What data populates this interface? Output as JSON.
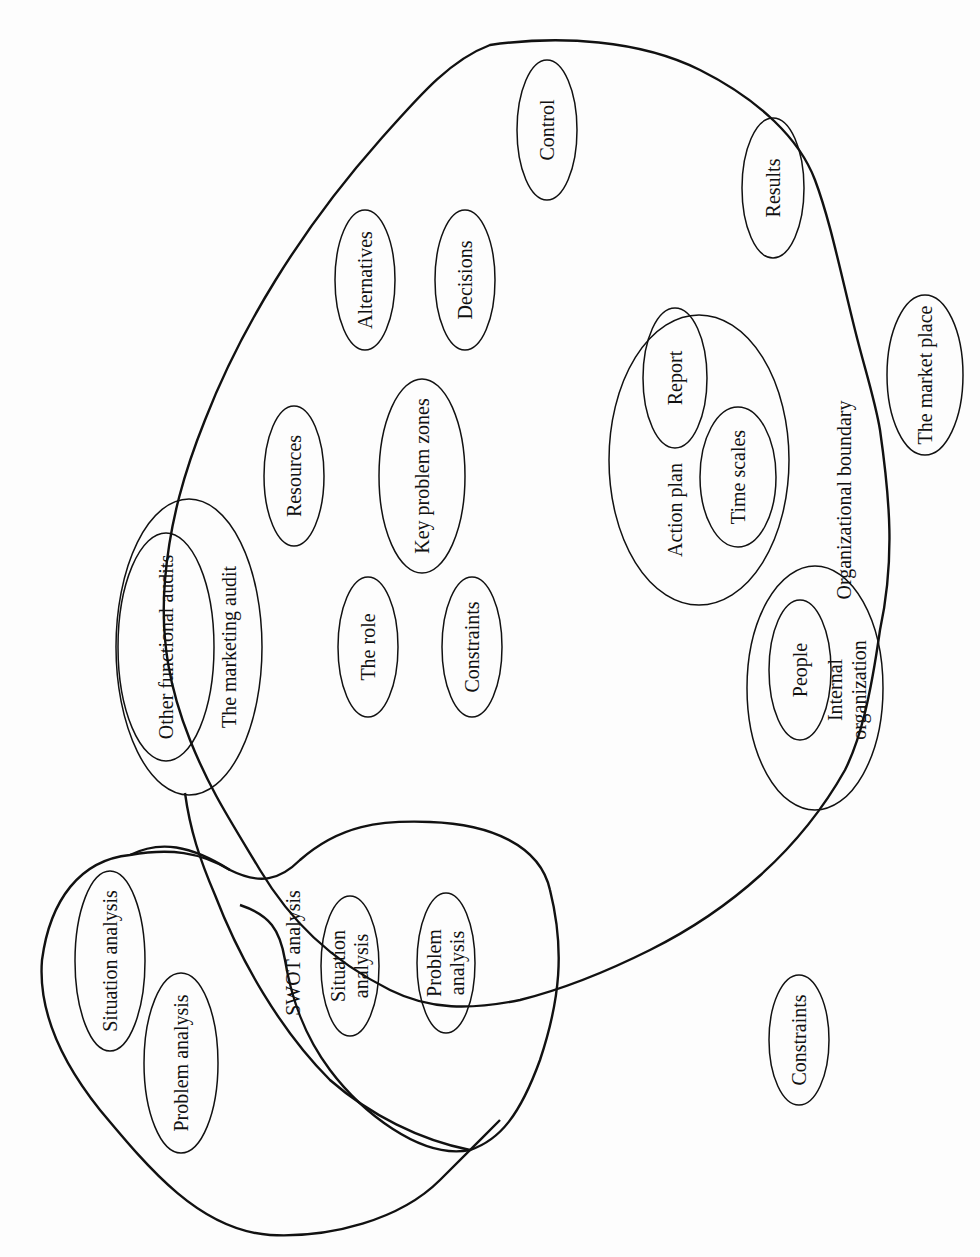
{
  "diagram": {
    "type": "concept-map",
    "orientation": "rotated-90-ccw",
    "stroke_color": "#111111",
    "background_color": "#fdfdfd",
    "regions": {
      "organizational_boundary": "Organizational boundary",
      "swot_analysis": "SWOT analysis"
    },
    "nodes": {
      "control": "Control",
      "results": "Results",
      "alternatives": "Alternatives",
      "decisions": "Decisions",
      "market_place": "The market place",
      "report": "Report",
      "action_plan": "Action plan",
      "time_scales": "Time scales",
      "resources": "Resources",
      "key_problem_zones": "Key problem zones",
      "other_functional_audits": "Other functional audits",
      "marketing_audit": "The marketing audit",
      "the_role": "The role",
      "constraints_inner": "Constraints",
      "people": "People",
      "internal_organization_1": "Internal",
      "internal_organization_2": "organization",
      "situation_analysis_outer": "Situation analysis",
      "problem_analysis_outer": "Problem analysis",
      "situation_analysis_swot_1": "Situation",
      "situation_analysis_swot_2": "analysis",
      "problem_analysis_swot_1": "Problem",
      "problem_analysis_swot_2": "analysis",
      "constraints_outer": "Constraints"
    }
  }
}
